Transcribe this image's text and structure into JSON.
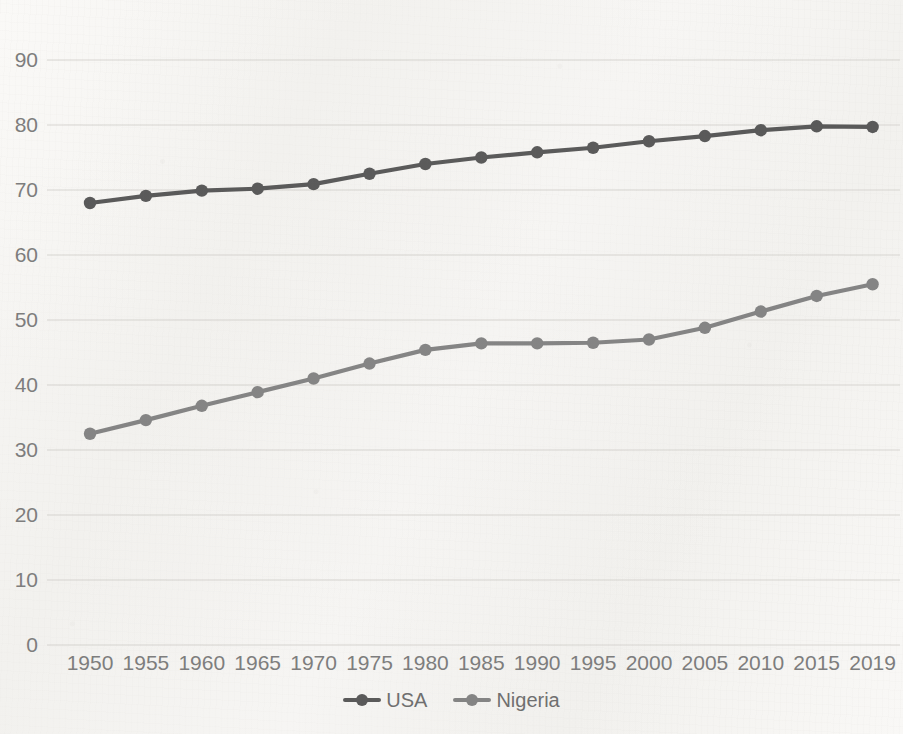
{
  "chart_data": {
    "type": "line",
    "title": "",
    "subtitle": "",
    "xlabel": "",
    "ylabel": "",
    "categories": [
      "1950",
      "1955",
      "1960",
      "1965",
      "1970",
      "1975",
      "1980",
      "1985",
      "1990",
      "1995",
      "2000",
      "2005",
      "2010",
      "2015",
      "2019"
    ],
    "ylim": [
      0,
      90
    ],
    "yticks": [
      0,
      10,
      20,
      30,
      40,
      50,
      60,
      70,
      80,
      90
    ],
    "grid": "horizontal",
    "legend_position": "bottom-center",
    "series": [
      {
        "name": "USA",
        "color": "#595959",
        "marker": "circle",
        "values": [
          68.0,
          69.1,
          69.9,
          70.2,
          70.9,
          72.5,
          74.0,
          75.0,
          75.8,
          76.5,
          77.5,
          78.3,
          79.2,
          79.8,
          79.7
        ]
      },
      {
        "name": "Nigeria",
        "color": "#848484",
        "marker": "circle",
        "values": [
          32.5,
          34.6,
          36.8,
          38.9,
          41.0,
          43.3,
          45.4,
          46.4,
          46.4,
          46.5,
          47.0,
          48.8,
          51.3,
          53.7,
          55.5
        ]
      }
    ]
  },
  "axis": {
    "y_tick_labels": [
      "90",
      "80",
      "70",
      "60",
      "50",
      "40",
      "30",
      "20",
      "10",
      "0"
    ],
    "x_tick_labels": [
      "1950",
      "1955",
      "1960",
      "1965",
      "1970",
      "1975",
      "1980",
      "1985",
      "1990",
      "1995",
      "2000",
      "2005",
      "2010",
      "2015",
      "2019"
    ]
  },
  "legend": {
    "items": [
      {
        "label": "USA",
        "color": "#595959"
      },
      {
        "label": "Nigeria",
        "color": "#848484"
      }
    ]
  },
  "colors": {
    "background": "#f7f6f4",
    "gridline": "#d8d6d2",
    "tick_text": "#7d7d7d",
    "series_usa": "#595959",
    "series_nigeria": "#848484"
  }
}
